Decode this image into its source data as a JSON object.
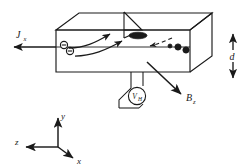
{
  "figure": {
    "name": "hall-effect-diagram",
    "background_color": "#ffffff",
    "line_color": "#1a1a1a"
  },
  "labels": {
    "current_density": {
      "symbol": "J",
      "subscript": "x",
      "full": "Jx"
    },
    "magnetic_field": {
      "symbol": "B",
      "subscript": "z",
      "full": "Bz"
    },
    "thickness": {
      "symbol": "d",
      "subscript": "",
      "full": "d"
    },
    "hall_voltage": {
      "symbol": "V",
      "subscript": "H",
      "full": "VH"
    }
  },
  "axes": {
    "y": "y",
    "z": "z",
    "x": "x"
  },
  "carriers": {
    "negative": [
      {
        "sign": "−"
      },
      {
        "sign": "−"
      }
    ],
    "positive_count": 3
  },
  "icons": {
    "current_arrow": "arrow-left-icon",
    "field_arrow": "arrow-down-right-icon",
    "thickness_arrows": "double-arrow-vertical-icon",
    "carrier_path_arrows": "curved-arrow-icon",
    "hole_drift_arrow": "dashed-arrow-left-icon",
    "contact_pad": "ellipse-contact-icon",
    "voltmeter": "voltmeter-circle-icon"
  }
}
